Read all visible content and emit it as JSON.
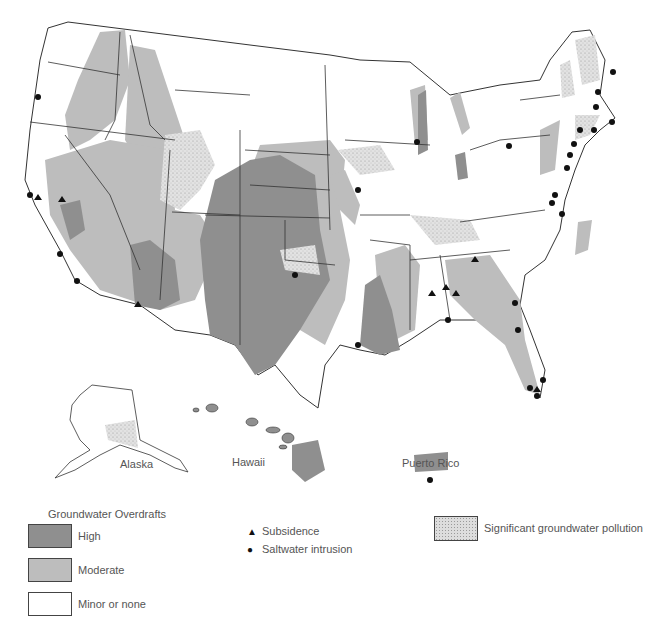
{
  "map": {
    "regions": {
      "alaska": "Alaska",
      "hawaii": "Hawaii",
      "puerto_rico": "Puerto Rico"
    }
  },
  "legend": {
    "overdrafts_title": "Groundwater Overdrafts",
    "overdrafts": [
      {
        "label": "High",
        "color": "#8f8f8f"
      },
      {
        "label": "Moderate",
        "color": "#bdbdbd"
      },
      {
        "label": "Minor or none",
        "color": "#ffffff"
      }
    ],
    "symbols": [
      {
        "label": "Subsidence",
        "icon": "triangle-icon",
        "glyph": "▲"
      },
      {
        "label": "Saltwater intrusion",
        "icon": "dot-icon",
        "glyph": "●"
      }
    ],
    "pollution": {
      "label": "Significant groundwater pollution",
      "pattern": "stippled"
    }
  },
  "colors": {
    "high": "#8f8f8f",
    "moderate": "#bdbdbd",
    "none": "#ffffff",
    "outline": "#333333"
  }
}
